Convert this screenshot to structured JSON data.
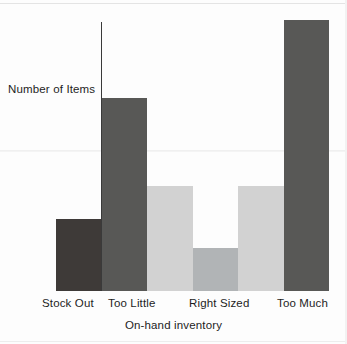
{
  "chart_data": {
    "type": "bar",
    "title": "",
    "xlabel": "On-hand inventory",
    "ylabel": "Number of Items",
    "grid": false,
    "legend": false,
    "ylim": [
      0,
      100
    ],
    "axis_note": "y-axis is unlabeled (no numeric ticks); values are relative bar heights",
    "categories": [
      "Stock Out",
      "Too Little",
      "Right Sized",
      "Too Much"
    ],
    "tick_labels": [
      "Stock Out",
      "Too Little",
      "Right Sized",
      "Too Much"
    ],
    "bars": [
      {
        "name": "stock-out",
        "label": "Stock Out",
        "value": 27,
        "color": "#3e3a38",
        "color_name": "dark-charcoal"
      },
      {
        "name": "too-little-high",
        "label": "Too Little",
        "value": 72,
        "color": "#585856",
        "color_name": "slate-gray"
      },
      {
        "name": "mid-left-light",
        "label": "",
        "value": 39,
        "color": "#d2d2d2",
        "color_name": "light-gray"
      },
      {
        "name": "right-sized",
        "label": "Right Sized",
        "value": 16,
        "color": "#b1b4b6",
        "color_name": "medium-gray"
      },
      {
        "name": "mid-right-light",
        "label": "",
        "value": 39,
        "color": "#d2d2d2",
        "color_name": "light-gray"
      },
      {
        "name": "too-much",
        "label": "Too Much",
        "value": 101,
        "color": "#585856",
        "color_name": "slate-gray"
      }
    ]
  },
  "labels": {
    "y_axis": "Number of Items",
    "x_axis": "On-hand inventory",
    "tick_stock_out": "Stock Out",
    "tick_too_little": "Too Little",
    "tick_right_sized": "Right Sized",
    "tick_too_much": "Too Much"
  },
  "colors": {
    "dark_charcoal": "#3e3a38",
    "slate_gray": "#585856",
    "light_gray": "#d2d2d2",
    "medium_gray": "#b1b4b6",
    "axis": "#3a3a3a",
    "text": "#1d1d1d",
    "background": "#fdfdfd"
  }
}
